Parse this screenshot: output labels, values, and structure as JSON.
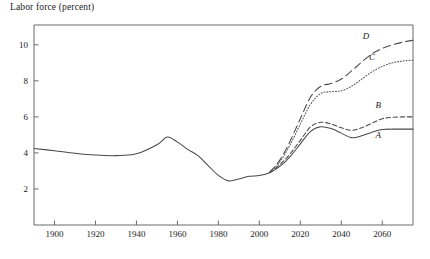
{
  "chart_data": {
    "type": "line",
    "title": "Labor force (percent)",
    "xlabel": "",
    "ylabel": "Labor force (percent)",
    "xlim": [
      1890,
      2075
    ],
    "ylim": [
      0,
      11.1
    ],
    "grid": false,
    "legend_position": "inline-right",
    "xticks": [
      1900,
      1920,
      1940,
      1960,
      1980,
      2000,
      2020,
      2040,
      2060
    ],
    "xtick_labels": [
      "1900",
      "1920",
      "1940",
      "1960",
      "1980",
      "2000",
      "2020",
      "2040",
      "2060"
    ],
    "yticks": [
      2,
      4,
      6,
      8,
      10
    ],
    "ytick_labels": [
      "2",
      "4",
      "6",
      "8",
      "10"
    ],
    "series": [
      {
        "name": "A",
        "label": "A",
        "style": "solid",
        "x": [
          1890,
          1900,
          1910,
          1920,
          1930,
          1940,
          1950,
          1955,
          1960,
          1965,
          1970,
          1975,
          1980,
          1985,
          1990,
          1995,
          2000,
          2005,
          2010,
          2015,
          2020,
          2025,
          2030,
          2035,
          2040,
          2045,
          2050,
          2055,
          2060,
          2065,
          2070,
          2075
        ],
        "values": [
          4.25,
          4.12,
          3.98,
          3.88,
          3.85,
          3.95,
          4.45,
          4.88,
          4.6,
          4.2,
          3.85,
          3.3,
          2.75,
          2.45,
          2.55,
          2.7,
          2.75,
          2.9,
          3.25,
          3.8,
          4.5,
          5.2,
          5.45,
          5.35,
          5.1,
          4.85,
          4.95,
          5.15,
          5.3,
          5.32,
          5.32,
          5.32
        ]
      },
      {
        "name": "B",
        "label": "B",
        "style": "dashed-short",
        "x": [
          2005,
          2010,
          2015,
          2020,
          2025,
          2030,
          2035,
          2040,
          2045,
          2050,
          2055,
          2060,
          2065,
          2070,
          2075
        ],
        "values": [
          2.9,
          3.35,
          3.95,
          4.7,
          5.45,
          5.7,
          5.6,
          5.4,
          5.25,
          5.4,
          5.65,
          5.9,
          5.98,
          6.0,
          6.0
        ]
      },
      {
        "name": "C",
        "label": "C",
        "style": "dotted",
        "x": [
          2005,
          2010,
          2015,
          2020,
          2025,
          2030,
          2035,
          2040,
          2045,
          2050,
          2055,
          2060,
          2065,
          2070,
          2075
        ],
        "values": [
          2.9,
          3.5,
          4.45,
          5.6,
          6.7,
          7.3,
          7.4,
          7.45,
          7.7,
          8.1,
          8.5,
          8.8,
          9.0,
          9.1,
          9.15
        ]
      },
      {
        "name": "D",
        "label": "D",
        "style": "dashed-long",
        "x": [
          2005,
          2010,
          2015,
          2020,
          2025,
          2030,
          2035,
          2040,
          2045,
          2050,
          2055,
          2060,
          2065,
          2070,
          2075
        ],
        "values": [
          2.92,
          3.6,
          4.65,
          5.9,
          7.1,
          7.7,
          7.85,
          8.1,
          8.55,
          9.05,
          9.5,
          9.8,
          10.0,
          10.15,
          10.25
        ]
      }
    ],
    "series_label_positions": [
      {
        "name": "A",
        "x": 2058,
        "y": 4.85
      },
      {
        "name": "B",
        "x": 2058,
        "y": 6.5
      },
      {
        "name": "C",
        "x": 2055,
        "y": 9.15
      },
      {
        "name": "D",
        "x": 2052,
        "y": 10.35
      }
    ]
  }
}
